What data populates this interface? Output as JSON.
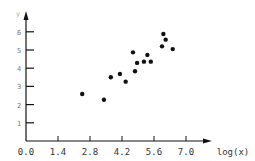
{
  "chart_data": {
    "type": "scatter",
    "title": "",
    "xlabel": "log(x)",
    "ylabel": "y",
    "xlim": [
      0.0,
      7.8
    ],
    "ylim": [
      0,
      6.9
    ],
    "x_ticks": [
      "0.0",
      "1.4",
      "2.8",
      "4.2",
      "5.6",
      "7.0"
    ],
    "y_ticks": [
      "1",
      "2",
      "3",
      "4",
      "5",
      "6"
    ],
    "grid": false,
    "legend": null,
    "points": [
      {
        "x": 2.46,
        "y": 2.58
      },
      {
        "x": 3.41,
        "y": 2.27
      },
      {
        "x": 3.71,
        "y": 3.5
      },
      {
        "x": 4.11,
        "y": 3.68
      },
      {
        "x": 4.36,
        "y": 3.26
      },
      {
        "x": 4.68,
        "y": 4.87
      },
      {
        "x": 4.77,
        "y": 3.83
      },
      {
        "x": 4.86,
        "y": 4.29
      },
      {
        "x": 5.16,
        "y": 4.36
      },
      {
        "x": 5.31,
        "y": 4.73
      },
      {
        "x": 5.46,
        "y": 4.36
      },
      {
        "x": 5.95,
        "y": 5.2
      },
      {
        "x": 6.01,
        "y": 5.88
      },
      {
        "x": 6.11,
        "y": 5.57
      },
      {
        "x": 6.42,
        "y": 5.05
      }
    ]
  },
  "colors": {
    "axis": "#111111",
    "point": "#111111",
    "text": "#333333"
  }
}
